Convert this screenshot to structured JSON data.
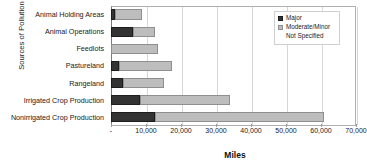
{
  "chart_data": {
    "type": "bar",
    "orientation": "horizontal",
    "stacked": true,
    "title": "",
    "xlabel": "Miles",
    "ylabel": "Sources of Pollution",
    "xlim": [
      0,
      70000
    ],
    "xticks": [
      0,
      10000,
      20000,
      30000,
      40000,
      50000,
      60000,
      70000
    ],
    "xticklabels": [
      "-",
      "10,000",
      "20,000",
      "30,000",
      "40,000",
      "50,000",
      "60,000",
      "70,000"
    ],
    "grid": "vertical",
    "legend_position": "top-right",
    "categories": [
      "Animal Holding Areas",
      "Animal Operations",
      "Feedlots",
      "Pastureland",
      "Rangeland",
      "Irrigated Crop Production",
      "Nonirrigated Crop Production"
    ],
    "series": [
      {
        "name": "Major",
        "color": "#333333",
        "values": [
          1200,
          6300,
          0,
          2300,
          3400,
          8300,
          12600
        ]
      },
      {
        "name": "Moderate/Minor",
        "color": "#bdbdbd",
        "values": [
          7800,
          6200,
          13400,
          15100,
          11700,
          25700,
          48400
        ]
      },
      {
        "name": "Not Specified",
        "color": "#ffffff",
        "values": [
          0,
          0,
          0,
          0,
          0,
          0,
          0
        ]
      }
    ],
    "totals": [
      9000,
      12500,
      13400,
      17400,
      15100,
      34000,
      61000
    ]
  },
  "legend": {
    "items": [
      {
        "label": "Major",
        "swatch": "legend-swatch-major"
      },
      {
        "label": "Moderate/Minor",
        "swatch": "legend-swatch-moderate-minor"
      },
      {
        "label": "Not Specified",
        "swatch": "legend-swatch-not-specified"
      }
    ]
  }
}
